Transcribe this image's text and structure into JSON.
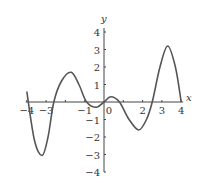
{
  "chart_data": {
    "type": "line",
    "title": "",
    "xlabel": "x",
    "ylabel": "y",
    "xlim": [
      -4,
      4
    ],
    "ylim": [
      -4,
      4
    ],
    "grid": false,
    "legend": null,
    "x_ticks": [
      -4,
      -3,
      -1,
      0,
      2,
      3,
      4
    ],
    "x_tick_labels": [
      "−4",
      "−3",
      "−1",
      "0",
      "2",
      "3",
      "4"
    ],
    "y_ticks": [
      4,
      3,
      2,
      1,
      -1,
      -2,
      -3,
      -4
    ],
    "y_tick_labels": [
      "4",
      "3",
      "2",
      "1",
      "−1",
      "−2",
      "−3",
      "−4"
    ],
    "series": [
      {
        "name": "f(x)",
        "x": [
          -4,
          -3.6,
          -3.2,
          -2.9,
          -2.6,
          -2.2,
          -1.7,
          -1.3,
          -0.9,
          -0.4,
          0,
          0.35,
          0.8,
          1.3,
          1.8,
          2.2,
          2.5,
          2.9,
          3.3,
          3.7,
          4
        ],
        "y": [
          0.6,
          -2.2,
          -3.05,
          -2.0,
          0,
          1.2,
          1.7,
          1.0,
          0,
          -0.3,
          0,
          0.3,
          0,
          -1.0,
          -1.6,
          -1.0,
          0,
          2.0,
          3.2,
          2.0,
          0
        ]
      }
    ],
    "color": "#555555"
  },
  "axes": {
    "x_label": "x",
    "y_label": "y"
  }
}
